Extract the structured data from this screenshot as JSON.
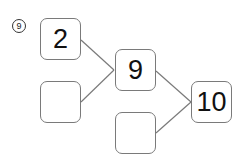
{
  "problem": {
    "number": "9",
    "boxes": {
      "top_left": "2",
      "bottom_left": "",
      "middle": "9",
      "right": "10",
      "bottom_middle": ""
    }
  },
  "colors": {
    "box_border": "#7a7a7a",
    "line": "#7a7a7a",
    "text": "#111111"
  }
}
